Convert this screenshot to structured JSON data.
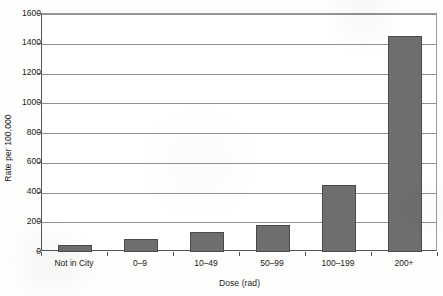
{
  "chart_data": {
    "type": "bar",
    "title": "",
    "xlabel": "Dose (rad)",
    "ylabel": "Rate per 100,000",
    "categories": [
      "Not in City",
      "0–9",
      "10–49",
      "50–99",
      "100–199",
      "200+"
    ],
    "values": [
      50,
      85,
      135,
      180,
      450,
      1450
    ],
    "ylim": [
      0,
      1600
    ],
    "yticks": [
      0,
      200,
      400,
      600,
      800,
      1000,
      1200,
      1400,
      1600
    ],
    "ytick_labels": [
      "0",
      "200",
      "400",
      "600",
      "800",
      "1000",
      "1200",
      "1400",
      "1600"
    ],
    "grid": "horizontal",
    "legend": "none",
    "bar_color": "#6e6e6e",
    "bar_edge_color": "#4a4a4a",
    "gridline_color": "#8f8f8f",
    "axis_color": "#555555",
    "background_color": "#ffffff"
  }
}
